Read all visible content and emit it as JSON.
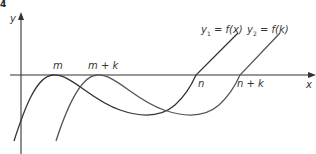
{
  "figure": {
    "corner_mark": "4",
    "axes": {
      "x_label": "x",
      "y_label": "y"
    },
    "x_axis_labels": {
      "m": "m",
      "m_plus_k": "m + k",
      "n": "n",
      "n_plus_k": "n + k"
    },
    "curves": [
      {
        "name": "y1",
        "label_var": "y",
        "label_sub": "1",
        "label_rest": " = f(x)",
        "color": "#333333"
      },
      {
        "name": "y2",
        "label_var": "y",
        "label_sub": "2",
        "label_rest": " = f(k)",
        "color": "#555555"
      }
    ],
    "colors": {
      "axis": "#333333",
      "curve1": "#333333",
      "curve2": "#555555"
    }
  }
}
